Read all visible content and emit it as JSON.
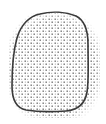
{
  "figure": {
    "stipple_color": "#707070",
    "outline_color": "#3a3a3a",
    "background_color": "#ffffff"
  }
}
